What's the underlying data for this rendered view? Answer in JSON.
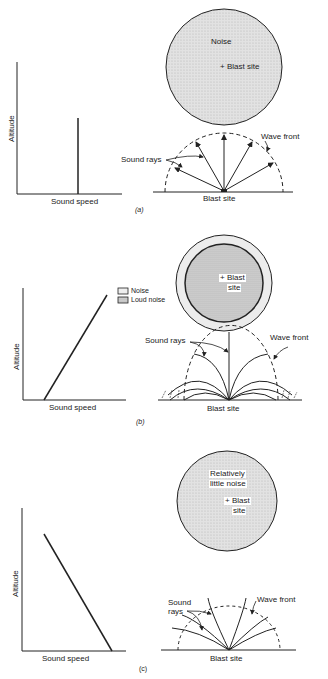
{
  "panels": [
    {
      "id": "a",
      "caption": "(a)",
      "graph": {
        "xlabel": "Sound speed",
        "ylabel": "Altitude",
        "profile": "constant (vertical line)"
      },
      "map": {
        "labels": [
          "Noise",
          "+ Blast site"
        ]
      },
      "rays": {
        "sound_rays_label": "Sound rays",
        "wave_front_label": "Wave front",
        "ground_label": "Blast site"
      }
    },
    {
      "id": "b",
      "caption": "(b)",
      "graph": {
        "xlabel": "Sound speed",
        "ylabel": "Altitude",
        "profile": "increasing with altitude"
      },
      "legend": {
        "items": [
          "Noise",
          "Loud noise"
        ]
      },
      "map": {
        "labels": [
          "+ Blast",
          "site"
        ]
      },
      "rays": {
        "sound_rays_label": "Sound rays",
        "wave_front_label": "Wave front",
        "ground_label": "Blast site"
      }
    },
    {
      "id": "c",
      "caption": "(c)",
      "graph": {
        "xlabel": "Sound speed",
        "ylabel": "Altitude",
        "profile": "decreasing with altitude"
      },
      "map": {
        "labels": [
          "Relatively",
          "little noise",
          "+ Blast",
          "site"
        ]
      },
      "rays": {
        "sound_rays_label_1": "Sound",
        "sound_rays_label_2": "rays",
        "wave_front_label": "Wave front",
        "ground_label": "Blast site"
      }
    }
  ],
  "colors": {
    "ink": "#222222",
    "fill_noise": "#e6e6e6",
    "fill_loud": "#d4d4d4"
  }
}
